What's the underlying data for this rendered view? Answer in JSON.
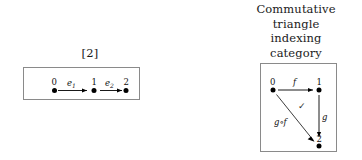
{
  "figure": {
    "background_color": "#ffffff",
    "box_border_color": "#8a8a8a",
    "ink_color": "#000000"
  },
  "left_panel": {
    "caption": "[2]",
    "diagram": {
      "type": "quiver",
      "nodes": [
        {
          "label": "0",
          "x": 28,
          "y": 52
        },
        {
          "label": "1",
          "x": 70,
          "y": 52
        },
        {
          "label": "2",
          "x": 104,
          "y": 52
        }
      ],
      "edges": [
        {
          "label": "e",
          "sub": "1",
          "from": "0",
          "to": "1"
        },
        {
          "label": "e",
          "sub": "2",
          "from": "1",
          "to": "2"
        }
      ]
    }
  },
  "right_panel": {
    "caption_lines": [
      "Commutative",
      "triangle",
      "indexing",
      "category"
    ],
    "diagram": {
      "type": "commutative-triangle",
      "nodes": [
        {
          "label": "0",
          "x": 12,
          "y": 25
        },
        {
          "label": "1",
          "x": 58,
          "y": 25
        },
        {
          "label": "2",
          "x": 58,
          "y": 82
        }
      ],
      "edges": [
        {
          "label": "f",
          "from": "0",
          "to": "1"
        },
        {
          "label": "g",
          "from": "1",
          "to": "2"
        },
        {
          "label": "g∘f",
          "from": "0",
          "to": "2"
        }
      ],
      "commutes_marker": "✓"
    }
  }
}
